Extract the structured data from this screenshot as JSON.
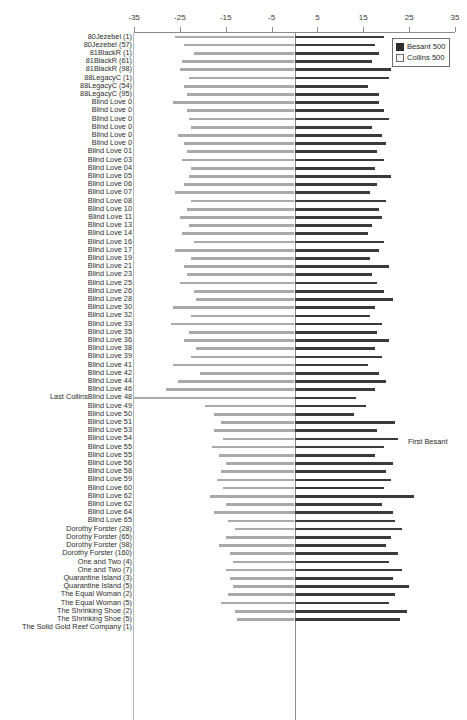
{
  "chart_data": {
    "type": "bar",
    "orientation": "horizontal-diverging",
    "title": "",
    "xlabel": "",
    "ylabel": "",
    "xlim": [
      -35,
      35
    ],
    "xticks": [
      -35,
      -25,
      -15,
      -5,
      5,
      15,
      25,
      35
    ],
    "xtick_labels": [
      "-35",
      "-25",
      "-15",
      "-5",
      "5",
      "15",
      "25",
      "35"
    ],
    "grid": false,
    "legend_position": "top-right",
    "series": [
      {
        "name": "Besant 500",
        "color": "#3a3a3a",
        "side": "positive"
      },
      {
        "name": "Collins 500",
        "color": "#a9a9a9",
        "side": "negative"
      }
    ],
    "annotations": [
      {
        "text": "First Besant",
        "row_index": 48
      },
      {
        "text": "Last Collins",
        "row_index": 48
      }
    ],
    "categories": [
      "80Jezebel (1)",
      "80Jezebel (57)",
      "81BlackR (1)",
      "81BlackR (61)",
      "81BlackR (98)",
      "88LegacyC (1)",
      "88LegacyC (54)",
      "88LegacyC (95)",
      "Blind Love 0",
      "Blind Love 0",
      "Blind Love 0",
      "Blind Love 0",
      "Blind Love 0",
      "Blind Love 0",
      "Blind Love 01",
      "Blind Love 03",
      "Blind Love 04",
      "Blind Love 05",
      "Blind Love 06",
      "Blind Love 07",
      "Blind Love 08",
      "Blind Love 10",
      "Blind Love 11",
      "Blind Love 13",
      "Blind Love 14",
      "Blind Love 16",
      "Blind Love 17",
      "Blind Love 19",
      "Blind Love 21",
      "Blind Love 23",
      "Blind Love 25",
      "Blind Love 26",
      "Blind Love 28",
      "Blind Love 30",
      "Blind Love 32",
      "Blind Love 33",
      "Blind Love 35",
      "Blind Love 36",
      "Blind Love 38",
      "Blind Love 39",
      "Blind Love 41",
      "Blind Love 42",
      "Blind Love 44",
      "Blind Love 46",
      "Last CollinsBlind Love 48",
      "Blind Love 49",
      "Blind Love 50",
      "Blind Love 51",
      "Blind Love 53",
      "Blind Love 54",
      "Blind Love 55",
      "Blind Love 55",
      "Blind Love 56",
      "Blind Love 58",
      "Blind Love 59",
      "Blind Love 60",
      "Blind Love 62",
      "Blind Love 62",
      "Blind Love 64",
      "Blind Love 65",
      "Dorothy Forster (28)",
      "Dorothy Forster (65)",
      "Dorothy Forster (98)",
      "Dorothy Forster (160)",
      "One and Two (4)",
      "One and Two (7)",
      "Quarantine Island (3)",
      "Quarantine Island (5)",
      "The Equal Woman (2)",
      "The Equal Woman (5)",
      "The Shrinking Shoe (2)",
      "The Shrinking Shoe (5)",
      "The Solid Gold Reef Company (1)"
    ],
    "collins_values": [
      -26.0,
      -24.0,
      -22.0,
      -24.5,
      -25.0,
      -23.0,
      -24.0,
      -23.5,
      -26.5,
      -23.5,
      -23.0,
      -22.5,
      -25.5,
      -24.0,
      -23.5,
      -24.5,
      -22.5,
      -23.0,
      -24.0,
      -26.0,
      -22.5,
      -23.5,
      -25.0,
      -23.0,
      -24.5,
      -22.0,
      -26.0,
      -22.5,
      -24.0,
      -23.5,
      -25.0,
      -22.0,
      -21.5,
      -26.5,
      -22.5,
      -27.0,
      -23.0,
      -24.0,
      -21.5,
      -22.5,
      -26.5,
      -20.5,
      -25.5,
      -28.0,
      -35.0,
      -19.5,
      -17.5,
      -16.0,
      -17.5,
      -15.5,
      -18.0,
      -16.5,
      -15.0,
      -16.0,
      -17.0,
      -15.5,
      -18.5,
      -15.0,
      -17.5,
      -14.5,
      -13.0,
      -15.0,
      -16.5,
      -14.0,
      -13.5,
      -15.0,
      -14.0,
      -13.5,
      -14.5,
      -16.0,
      -13.0,
      -12.5
    ],
    "besant_values": [
      19.5,
      17.5,
      18.5,
      17.0,
      21.0,
      20.5,
      16.0,
      18.5,
      18.5,
      19.5,
      20.5,
      17.0,
      19.0,
      20.0,
      18.0,
      19.5,
      17.5,
      21.0,
      18.0,
      16.5,
      20.0,
      18.5,
      19.0,
      17.0,
      16.0,
      19.5,
      18.5,
      16.5,
      20.5,
      17.0,
      18.0,
      19.5,
      21.5,
      17.5,
      16.5,
      19.0,
      18.0,
      20.5,
      17.5,
      19.0,
      16.0,
      18.5,
      20.0,
      17.5,
      13.5,
      15.5,
      13.0,
      22.0,
      18.0,
      22.5,
      19.5,
      17.5,
      21.5,
      20.0,
      21.0,
      19.5,
      26.0,
      19.0,
      21.5,
      22.0,
      23.5,
      21.0,
      20.0,
      22.5,
      20.5,
      23.5,
      21.5,
      25.0,
      22.0,
      20.5,
      24.5,
      23.0
    ]
  },
  "legend": {
    "items": [
      {
        "label": "Besant 500",
        "swatch": "filled-square-dark"
      },
      {
        "label": "Collins 500",
        "swatch": "open-square-light"
      }
    ]
  },
  "annotations": {
    "first_besant": "First Besant"
  }
}
